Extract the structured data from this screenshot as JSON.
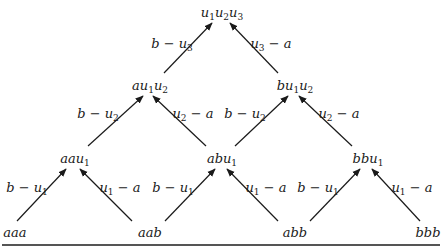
{
  "diagram": {
    "type": "tree",
    "nodes": [
      {
        "id": "n0",
        "base": "u",
        "parts": [
          [
            "u",
            "1"
          ],
          [
            "u",
            "2"
          ],
          [
            "u",
            "3"
          ]
        ],
        "x": 222,
        "y": 12
      },
      {
        "id": "n1",
        "parts": [
          [
            "a",
            ""
          ],
          [
            "u",
            "1"
          ],
          [
            "u",
            "2"
          ]
        ],
        "x": 150,
        "y": 85
      },
      {
        "id": "n2",
        "parts": [
          [
            "b",
            ""
          ],
          [
            "u",
            "1"
          ],
          [
            "u",
            "2"
          ]
        ],
        "x": 295,
        "y": 85
      },
      {
        "id": "n3",
        "parts": [
          [
            "aa",
            ""
          ],
          [
            "u",
            "1"
          ]
        ],
        "x": 75,
        "y": 158
      },
      {
        "id": "n4",
        "parts": [
          [
            "ab",
            ""
          ],
          [
            "u",
            "1"
          ]
        ],
        "x": 222,
        "y": 158
      },
      {
        "id": "n5",
        "parts": [
          [
            "bb",
            ""
          ],
          [
            "u",
            "1"
          ]
        ],
        "x": 368,
        "y": 158
      },
      {
        "id": "n6",
        "parts": [
          [
            "aaa",
            ""
          ]
        ],
        "x": 15,
        "y": 232
      },
      {
        "id": "n7",
        "parts": [
          [
            "aab",
            ""
          ]
        ],
        "x": 150,
        "y": 232
      },
      {
        "id": "n8",
        "parts": [
          [
            "abb",
            ""
          ]
        ],
        "x": 295,
        "y": 232
      },
      {
        "id": "n9",
        "parts": [
          [
            "bbb",
            ""
          ]
        ],
        "x": 428,
        "y": 232
      }
    ],
    "node_labels": {
      "n0": "u1u2u3",
      "n1": "au1u2",
      "n2": "bu1u2",
      "n3": "aau1",
      "n4": "abu1",
      "n5": "bbu1",
      "n6": "aaa",
      "n7": "aab",
      "n8": "abb",
      "n9": "bbb"
    },
    "edges": [
      {
        "from": "n1",
        "to": "n0",
        "x1": 164,
        "y1": 73,
        "x2": 212,
        "y2": 23,
        "label": "b − u3",
        "lx": 172,
        "ly": 43,
        "parts": [
          [
            "b − u",
            "3"
          ]
        ]
      },
      {
        "from": "n2",
        "to": "n0",
        "x1": 278,
        "y1": 73,
        "x2": 230,
        "y2": 23,
        "label": "u3 − a",
        "lx": 271,
        "ly": 43,
        "parts": [
          [
            "u",
            "3"
          ],
          [
            " − a",
            ""
          ]
        ]
      },
      {
        "from": "n3",
        "to": "n1",
        "x1": 88,
        "y1": 146,
        "x2": 143,
        "y2": 96,
        "label": "b − u2",
        "lx": 98,
        "ly": 113,
        "parts": [
          [
            "b − u",
            "2"
          ]
        ]
      },
      {
        "from": "n4",
        "to": "n1",
        "x1": 206,
        "y1": 146,
        "x2": 153,
        "y2": 96,
        "label": "u2 − a",
        "lx": 193,
        "ly": 113,
        "parts": [
          [
            "u",
            "2"
          ],
          [
            " − a",
            ""
          ]
        ]
      },
      {
        "from": "n4",
        "to": "n2",
        "x1": 235,
        "y1": 146,
        "x2": 288,
        "y2": 96,
        "label": "b − u2",
        "lx": 245,
        "ly": 113,
        "parts": [
          [
            "b − u",
            "2"
          ]
        ]
      },
      {
        "from": "n5",
        "to": "n2",
        "x1": 352,
        "y1": 146,
        "x2": 299,
        "y2": 96,
        "label": "u2 − a",
        "lx": 339,
        "ly": 113,
        "parts": [
          [
            "u",
            "2"
          ],
          [
            " − a",
            ""
          ]
        ]
      },
      {
        "from": "n6",
        "to": "n3",
        "x1": 17,
        "y1": 221,
        "x2": 66,
        "y2": 169,
        "label": "b − u1",
        "lx": 27,
        "ly": 187,
        "parts": [
          [
            "b − u",
            "1"
          ]
        ]
      },
      {
        "from": "n7",
        "to": "n3",
        "x1": 132,
        "y1": 221,
        "x2": 80,
        "y2": 169,
        "label": "u1 − a",
        "lx": 120,
        "ly": 187,
        "parts": [
          [
            "u",
            "1"
          ],
          [
            " − a",
            ""
          ]
        ]
      },
      {
        "from": "n7",
        "to": "n4",
        "x1": 165,
        "y1": 221,
        "x2": 215,
        "y2": 169,
        "label": "b − u1",
        "lx": 173,
        "ly": 187,
        "parts": [
          [
            "b − u",
            "1"
          ]
        ]
      },
      {
        "from": "n8",
        "to": "n4",
        "x1": 278,
        "y1": 221,
        "x2": 227,
        "y2": 169,
        "label": "u1 − a",
        "lx": 266,
        "ly": 187,
        "parts": [
          [
            "u",
            "1"
          ],
          [
            " − a",
            ""
          ]
        ]
      },
      {
        "from": "n8",
        "to": "n5",
        "x1": 310,
        "y1": 221,
        "x2": 360,
        "y2": 169,
        "label": "b − u1",
        "lx": 318,
        "ly": 187,
        "parts": [
          [
            "b − u",
            "1"
          ]
        ]
      },
      {
        "from": "n9",
        "to": "n5",
        "x1": 420,
        "y1": 221,
        "x2": 372,
        "y2": 169,
        "label": "u1 − a",
        "lx": 412,
        "ly": 187,
        "parts": [
          [
            "u",
            "1"
          ],
          [
            " − a",
            ""
          ]
        ]
      }
    ],
    "colors": {
      "ink": "#1a1a1a",
      "rule": "#555555",
      "background": "#ffffff"
    }
  }
}
